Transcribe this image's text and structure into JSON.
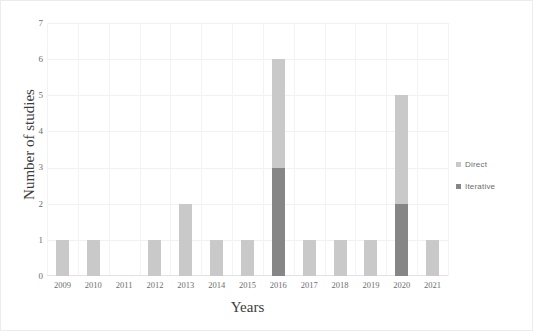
{
  "chart_data": {
    "type": "bar",
    "stacked": true,
    "title": "",
    "xlabel": "Years",
    "ylabel": "Number of studies",
    "categories": [
      "2009",
      "2010",
      "2011",
      "2012",
      "2013",
      "2014",
      "2015",
      "2016",
      "2017",
      "2018",
      "2019",
      "2020",
      "2021"
    ],
    "series": [
      {
        "name": "Direct",
        "color": "#c9c9c9",
        "values": [
          1,
          1,
          0,
          1,
          2,
          1,
          1,
          3,
          1,
          1,
          1,
          3,
          1
        ]
      },
      {
        "name": "Iterative",
        "color": "#868686",
        "values": [
          0,
          0,
          0,
          0,
          0,
          0,
          0,
          3,
          0,
          0,
          0,
          2,
          0
        ]
      }
    ],
    "totals": [
      1,
      1,
      0,
      1,
      2,
      1,
      1,
      6,
      1,
      1,
      1,
      5,
      1
    ],
    "ylim": [
      0,
      7
    ],
    "ytick_labels": [
      "0",
      "1",
      "2",
      "3",
      "4",
      "5",
      "6",
      "7"
    ],
    "ytick_values": [
      0,
      1,
      2,
      3,
      4,
      5,
      6,
      7
    ],
    "grid": true,
    "legend_position": "right"
  },
  "legend": {
    "items": [
      {
        "label": "Direct",
        "color": "#c9c9c9",
        "marker": "square-swatch-icon"
      },
      {
        "label": "Iterative",
        "color": "#868686",
        "marker": "square-swatch-icon"
      }
    ]
  },
  "axes": {
    "x_title": "Years",
    "y_title": "Number of studies"
  }
}
